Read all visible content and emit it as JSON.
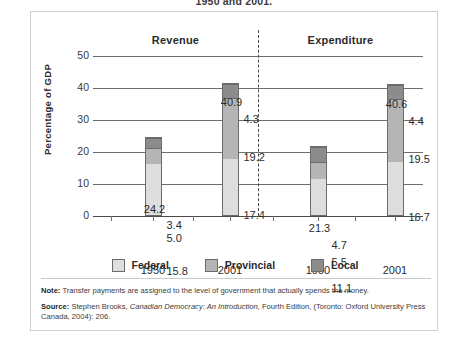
{
  "caption": "1950 and 2001.",
  "chart_data": {
    "type": "bar",
    "subtype": "stacked",
    "title": "",
    "xlabel": "",
    "ylabel": "Percentage of GDP",
    "ylim": [
      0,
      50
    ],
    "yticks": [
      0,
      10,
      20,
      30,
      40,
      50
    ],
    "grid": true,
    "legend_position": "bottom",
    "panels": [
      {
        "name": "Revenue",
        "categories": [
          "1950",
          "2001"
        ]
      },
      {
        "name": "Expenditure",
        "categories": [
          "1950",
          "2001"
        ]
      }
    ],
    "categories": [
      "1950",
      "2001",
      "1950",
      "2001"
    ],
    "series": [
      {
        "name": "Federal",
        "values": [
          15.8,
          17.4,
          11.1,
          16.7
        ],
        "color": "#dedede"
      },
      {
        "name": "Provincial",
        "values": [
          5.0,
          19.2,
          5.5,
          19.5
        ],
        "color": "#b5b5b5"
      },
      {
        "name": "Local",
        "values": [
          3.4,
          4.3,
          4.7,
          4.4
        ],
        "color": "#8c8c8c"
      }
    ],
    "totals": [
      24.2,
      40.9,
      21.3,
      40.6
    ],
    "bars": [
      {
        "panel": "Revenue",
        "category": "1950",
        "total": "24.2",
        "segments": [
          {
            "series": "Federal",
            "label": "15.8",
            "value": 15.8
          },
          {
            "series": "Provincial",
            "label": "5.0",
            "value": 5.0
          },
          {
            "series": "Local",
            "label": "3.4",
            "value": 3.4
          }
        ]
      },
      {
        "panel": "Revenue",
        "category": "2001",
        "total": "40.9",
        "segments": [
          {
            "series": "Federal",
            "label": "17.4",
            "value": 17.4
          },
          {
            "series": "Provincial",
            "label": "19.2",
            "value": 19.2
          },
          {
            "series": "Local",
            "label": "4.3",
            "value": 4.3
          }
        ]
      },
      {
        "panel": "Expenditure",
        "category": "1950",
        "total": "21.3",
        "segments": [
          {
            "series": "Federal",
            "label": "11.1",
            "value": 11.1
          },
          {
            "series": "Provincial",
            "label": "5.5",
            "value": 5.5
          },
          {
            "series": "Local",
            "label": "4.7",
            "value": 4.7
          }
        ]
      },
      {
        "panel": "Expenditure",
        "category": "2001",
        "total": "40.6",
        "segments": [
          {
            "series": "Federal",
            "label": "16.7",
            "value": 16.7
          },
          {
            "series": "Provincial",
            "label": "19.5",
            "value": 19.5
          },
          {
            "series": "Local",
            "label": "4.4",
            "value": 4.4
          }
        ]
      }
    ]
  },
  "axis": {
    "y_title": "Percentage of GDP",
    "y_ticks": [
      "50",
      "40",
      "30",
      "20",
      "10",
      "0"
    ],
    "x_ticks": [
      "1950",
      "2001",
      "1950",
      "2001"
    ]
  },
  "headers": {
    "revenue": "Revenue",
    "expenditure": "Expenditure"
  },
  "legend": {
    "items": [
      {
        "label": "Federal",
        "color": "#dedede"
      },
      {
        "label": "Provincial",
        "color": "#b5b5b5"
      },
      {
        "label": "Local",
        "color": "#8c8c8c"
      }
    ]
  },
  "footnotes": {
    "note_key": "Note:",
    "note_text": "Transfer payments are assigned to the level of government that actually spends the money.",
    "source_key": "Source:",
    "source_pre": "Stephen Brooks,",
    "source_italic": "Canadian Democracy: An Introduction,",
    "source_post": "Fourth Edition, (Toronto: Oxford University Press Canada, 2004): 206."
  }
}
